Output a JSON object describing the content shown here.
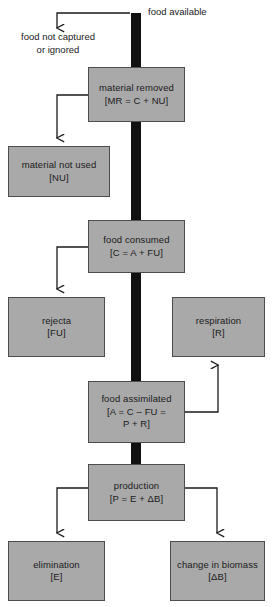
{
  "diagram": {
    "trunk_color": "#111111",
    "box_fill": "#a9a9a9",
    "box_stroke": "#4d4d4d",
    "connector_color": "#1a1a1a",
    "labels": {
      "food_available": "food available",
      "food_not_captured_line1": "food not captured",
      "food_not_captured_line2": "or ignored"
    },
    "nodes": [
      {
        "id": "material-removed",
        "lines": [
          "material removed",
          "[MR  =  C  +  NU]"
        ],
        "x": 88,
        "y": 67,
        "w": 97,
        "h": 55
      },
      {
        "id": "material-not-used",
        "lines": [
          "material not used",
          "[NU]"
        ],
        "x": 8,
        "y": 146,
        "w": 102,
        "h": 51
      },
      {
        "id": "food-consumed",
        "lines": [
          "food consumed",
          "[C  =  A  +  FU]"
        ],
        "x": 88,
        "y": 220,
        "w": 97,
        "h": 53
      },
      {
        "id": "rejecta",
        "lines": [
          "rejecta",
          "[FU]"
        ],
        "x": 8,
        "y": 297,
        "w": 97,
        "h": 60
      },
      {
        "id": "respiration",
        "lines": [
          "respiration",
          "[R]"
        ],
        "x": 172,
        "y": 297,
        "w": 93,
        "h": 60
      },
      {
        "id": "food-assimilated",
        "lines": [
          "food assimilated",
          "[A  =  C  –  FU  =",
          "P  +  R]"
        ],
        "x": 88,
        "y": 381,
        "w": 97,
        "h": 62
      },
      {
        "id": "production",
        "lines": [
          "production",
          "[P  =  E  +  ΔB]"
        ],
        "x": 88,
        "y": 464,
        "w": 97,
        "h": 57
      },
      {
        "id": "elimination",
        "lines": [
          "elimination",
          "[E]"
        ],
        "x": 8,
        "y": 541,
        "w": 97,
        "h": 60
      },
      {
        "id": "change-in-biomass",
        "lines": [
          "change in biomass",
          "[ΔB]"
        ],
        "x": 170,
        "y": 541,
        "w": 95,
        "h": 60
      }
    ]
  }
}
